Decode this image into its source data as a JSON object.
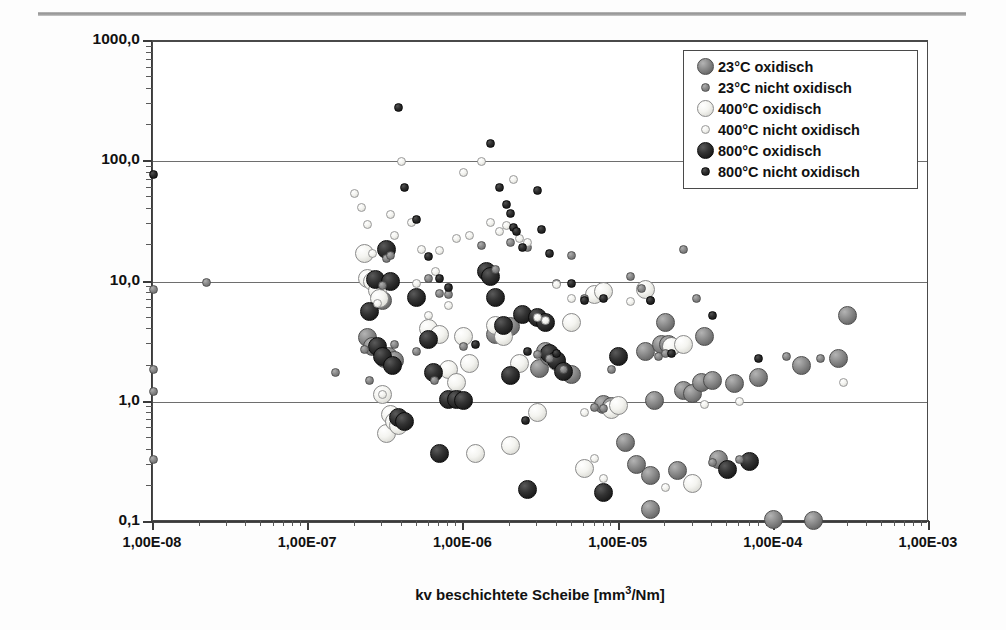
{
  "figure": {
    "background": "#ffffff",
    "frame_color": "#4a4a4a",
    "has_top_rule": true
  },
  "axes": {
    "x_title": "kv  beschichtete Scheibe [mm",
    "x_title_sup": "3",
    "x_title_tail": "/Nm]",
    "y_title": "P x V [MPa*ms",
    "y_title_sup": "-1",
    "y_title_tail": "]",
    "x_ticklabels": [
      "1,00E-08",
      "1,00E-07",
      "1,00E-06",
      "1,00E-05",
      "1,00E-04",
      "1,00E-03"
    ],
    "y_ticklabels": [
      "1000,0",
      "100,0",
      "10,0",
      "1,0",
      "0,1"
    ]
  },
  "legend": {
    "position": "top-right",
    "entries": [
      {
        "label": "23°C oxidisch",
        "series": 0,
        "size": "large",
        "color": "#8f8f8f"
      },
      {
        "label": "23°C nicht oxidisch",
        "series": 1,
        "size": "small",
        "color": "#898989"
      },
      {
        "label": "400°C oxidisch",
        "series": 2,
        "size": "large",
        "color": "#ffffff"
      },
      {
        "label": "400°C nicht oxidisch",
        "series": 3,
        "size": "small",
        "color": "#ffffff"
      },
      {
        "label": "800°C oxidisch",
        "series": 4,
        "size": "large",
        "color": "#1c1c1c"
      },
      {
        "label": "800°C nicht oxidisch",
        "series": 5,
        "size": "small",
        "color": "#141414"
      }
    ]
  },
  "chart_data": {
    "type": "scatter",
    "title": "",
    "xlabel": "kv  beschichtete Scheibe [mm³/Nm]",
    "ylabel": "P x V [MPa*ms⁻¹]",
    "xscale": "log",
    "yscale": "log",
    "xlim": [
      1e-08,
      0.001
    ],
    "ylim": [
      0.1,
      1000.0
    ],
    "grid": "horizontal-decades",
    "legend_position": "top-right",
    "series": [
      {
        "name": "23°C oxidisch",
        "marker": "sphere-large",
        "color": "#8f8f8f",
        "points": [
          [
            2.4e-07,
            3.4
          ],
          [
            2.6e-07,
            2.9
          ],
          [
            3e-07,
            7.0
          ],
          [
            3.1e-07,
            2.3
          ],
          [
            3.3e-07,
            2.4
          ],
          [
            3.6e-07,
            2.2
          ],
          [
            1.6e-06,
            3.6
          ],
          [
            2e-06,
            4.2
          ],
          [
            3.1e-06,
            1.9
          ],
          [
            3.4e-06,
            2.6
          ],
          [
            3.6e-06,
            2.4
          ],
          [
            5e-06,
            1.7
          ],
          [
            8e-06,
            0.95
          ],
          [
            9e-06,
            0.92
          ],
          [
            1.1e-05,
            0.46
          ],
          [
            1.3e-05,
            0.3
          ],
          [
            1.5e-05,
            2.6
          ],
          [
            1.6e-05,
            0.245
          ],
          [
            1.6e-05,
            0.126
          ],
          [
            1.7e-05,
            1.02
          ],
          [
            1.9e-05,
            3.0
          ],
          [
            2e-05,
            4.6
          ],
          [
            2.1e-05,
            3.0
          ],
          [
            2.2e-05,
            2.9
          ],
          [
            2.4e-05,
            0.27
          ],
          [
            2.6e-05,
            1.25
          ],
          [
            3e-05,
            1.17
          ],
          [
            3.4e-05,
            1.45
          ],
          [
            3.6e-05,
            3.5
          ],
          [
            4e-05,
            1.5
          ],
          [
            4.4e-05,
            0.33
          ],
          [
            5.6e-05,
            1.42
          ],
          [
            8e-05,
            1.6
          ],
          [
            0.0001,
            0.105
          ],
          [
            0.00015,
            2.0
          ],
          [
            0.00018,
            0.102
          ],
          [
            0.00026,
            2.3
          ],
          [
            0.0003,
            5.2
          ]
        ]
      },
      {
        "name": "23°C nicht oxidisch",
        "marker": "sphere-small",
        "color": "#898989",
        "points": [
          [
            1e-08,
            8.6
          ],
          [
            1e-08,
            1.85
          ],
          [
            1e-08,
            1.22
          ],
          [
            1e-08,
            0.33
          ],
          [
            2.2e-08,
            9.8
          ],
          [
            1.5e-07,
            1.75
          ],
          [
            2.3e-07,
            2.7
          ],
          [
            2.5e-07,
            1.5
          ],
          [
            3e-07,
            9.3
          ],
          [
            3.2e-07,
            15.5
          ],
          [
            3.4e-07,
            16.5
          ],
          [
            3.6e-07,
            3.0
          ],
          [
            5e-07,
            2.6
          ],
          [
            6e-07,
            10.5
          ],
          [
            6.5e-07,
            1.5
          ],
          [
            7e-07,
            8.0
          ],
          [
            8e-07,
            7.8
          ],
          [
            1e-06,
            2.9
          ],
          [
            1.3e-06,
            20.0
          ],
          [
            1.6e-06,
            12.5
          ],
          [
            2e-06,
            21.0
          ],
          [
            2.6e-06,
            19.0
          ],
          [
            3e-06,
            2.45
          ],
          [
            3.6e-06,
            2.3
          ],
          [
            4e-06,
            9.7
          ],
          [
            4.4e-06,
            1.85
          ],
          [
            5e-06,
            16.5
          ],
          [
            6e-06,
            7.2
          ],
          [
            7e-06,
            0.9
          ],
          [
            8e-06,
            0.88
          ],
          [
            9e-06,
            1.85
          ],
          [
            1.2e-05,
            11.0
          ],
          [
            1.4e-05,
            8.8
          ],
          [
            1.6e-05,
            7.0
          ],
          [
            1.8e-05,
            2.4
          ],
          [
            2e-05,
            2.5
          ],
          [
            2.6e-05,
            18.5
          ],
          [
            3.2e-05,
            7.2
          ],
          [
            4e-05,
            0.31
          ],
          [
            6e-05,
            0.33
          ],
          [
            0.00012,
            2.4
          ],
          [
            0.0002,
            2.3
          ]
        ]
      },
      {
        "name": "400°C oxidisch",
        "marker": "sphere-large",
        "color": "#ffffff",
        "points": [
          [
            2.3e-07,
            17.0
          ],
          [
            2.4e-07,
            10.6
          ],
          [
            2.6e-07,
            10.0
          ],
          [
            2.8e-07,
            8.4
          ],
          [
            2.9e-07,
            7.2
          ],
          [
            3e-07,
            1.15
          ],
          [
            3.2e-07,
            0.54
          ],
          [
            3.4e-07,
            0.78
          ],
          [
            3.6e-07,
            0.68
          ],
          [
            3.8e-07,
            0.64
          ],
          [
            6e-07,
            4.1
          ],
          [
            7e-07,
            3.6
          ],
          [
            8e-07,
            1.85
          ],
          [
            9e-07,
            1.45
          ],
          [
            1e-06,
            3.5
          ],
          [
            1.1e-06,
            2.1
          ],
          [
            1.2e-06,
            0.37
          ],
          [
            1.6e-06,
            4.3
          ],
          [
            1.8e-06,
            3.5
          ],
          [
            2e-06,
            0.43
          ],
          [
            2.3e-06,
            2.1
          ],
          [
            3e-06,
            0.82
          ],
          [
            4e-06,
            2.15
          ],
          [
            5e-06,
            4.6
          ],
          [
            6e-06,
            0.28
          ],
          [
            7e-06,
            7.8
          ],
          [
            8e-06,
            8.2
          ],
          [
            9e-06,
            0.86
          ],
          [
            1e-05,
            0.93
          ],
          [
            1.5e-05,
            8.5
          ],
          [
            2.2e-05,
            2.9
          ],
          [
            2.6e-05,
            3.0
          ],
          [
            3e-05,
            0.21
          ]
        ]
      },
      {
        "name": "400°C nicht oxidisch",
        "marker": "sphere-small",
        "color": "#ffffff",
        "points": [
          [
            2e-07,
            54.0
          ],
          [
            2.2e-07,
            41.0
          ],
          [
            2.4e-07,
            30.0
          ],
          [
            2.6e-07,
            17.0
          ],
          [
            2.8e-07,
            6.6
          ],
          [
            3e-07,
            1.15
          ],
          [
            3.4e-07,
            36.0
          ],
          [
            3.6e-07,
            24.0
          ],
          [
            4e-07,
            100.0
          ],
          [
            4.6e-07,
            31.0
          ],
          [
            5e-07,
            9.6
          ],
          [
            5.4e-07,
            18.5
          ],
          [
            6e-07,
            5.2
          ],
          [
            6.6e-07,
            12.0
          ],
          [
            7e-07,
            18.0
          ],
          [
            8e-07,
            6.3
          ],
          [
            9e-07,
            23.0
          ],
          [
            1e-06,
            80.0
          ],
          [
            1.1e-06,
            24.0
          ],
          [
            1.3e-06,
            100.0
          ],
          [
            1.5e-06,
            31.0
          ],
          [
            1.7e-06,
            26.0
          ],
          [
            1.9e-06,
            29.0
          ],
          [
            2.1e-06,
            70.0
          ],
          [
            2.3e-06,
            23.0
          ],
          [
            2.6e-06,
            21.0
          ],
          [
            3e-06,
            5.0
          ],
          [
            3.4e-06,
            4.7
          ],
          [
            4e-06,
            9.4
          ],
          [
            5e-06,
            7.2
          ],
          [
            6e-06,
            0.81
          ],
          [
            7e-06,
            0.34
          ],
          [
            8e-06,
            0.23
          ],
          [
            1.2e-05,
            6.8
          ],
          [
            2e-05,
            0.195
          ],
          [
            3.6e-05,
            0.95
          ],
          [
            6e-05,
            1.0
          ],
          [
            0.00028,
            1.45
          ]
        ]
      },
      {
        "name": "800°C oxidisch",
        "marker": "sphere-large",
        "color": "#1c1c1c",
        "points": [
          [
            2.5e-07,
            5.6
          ],
          [
            2.7e-07,
            10.3
          ],
          [
            2.8e-07,
            2.9
          ],
          [
            3e-07,
            2.4
          ],
          [
            3.2e-07,
            18.5
          ],
          [
            3.4e-07,
            10.0
          ],
          [
            3.5e-07,
            2.0
          ],
          [
            3.8e-07,
            0.74
          ],
          [
            4.2e-07,
            0.69
          ],
          [
            5e-07,
            7.4
          ],
          [
            6e-07,
            3.3
          ],
          [
            6.4e-07,
            1.75
          ],
          [
            7e-07,
            0.37
          ],
          [
            8e-07,
            1.05
          ],
          [
            9e-07,
            1.05
          ],
          [
            1e-06,
            1.02
          ],
          [
            1.4e-06,
            12.0
          ],
          [
            1.5e-06,
            11.0
          ],
          [
            1.6e-06,
            7.4
          ],
          [
            1.8e-06,
            4.3
          ],
          [
            2e-06,
            1.65
          ],
          [
            2.4e-06,
            5.3
          ],
          [
            2.6e-06,
            0.185
          ],
          [
            3e-06,
            5.0
          ],
          [
            3.4e-06,
            4.6
          ],
          [
            3.6e-06,
            2.5
          ],
          [
            4e-06,
            2.2
          ],
          [
            4.4e-06,
            1.8
          ],
          [
            8e-06,
            0.175
          ],
          [
            1e-05,
            2.4
          ],
          [
            5e-05,
            0.275
          ],
          [
            7e-05,
            0.32
          ]
        ]
      },
      {
        "name": "800°C nicht oxidisch",
        "marker": "sphere-small",
        "color": "#141414",
        "points": [
          [
            1e-08,
            78.0
          ],
          [
            3.8e-07,
            280.0
          ],
          [
            4.2e-07,
            60.0
          ],
          [
            5e-07,
            33.0
          ],
          [
            6e-07,
            16.0
          ],
          [
            7e-07,
            10.6
          ],
          [
            8e-07,
            9.0
          ],
          [
            1.2e-06,
            3.0
          ],
          [
            1.5e-06,
            140.0
          ],
          [
            1.7e-06,
            60.0
          ],
          [
            1.9e-06,
            44.0
          ],
          [
            2e-06,
            37.0
          ],
          [
            2.1e-06,
            28.0
          ],
          [
            2.2e-06,
            26.0
          ],
          [
            2.4e-06,
            19.0
          ],
          [
            2.5e-06,
            0.7
          ],
          [
            2.6e-06,
            2.6
          ],
          [
            3e-06,
            57.0
          ],
          [
            3.2e-06,
            27.0
          ],
          [
            3.6e-06,
            17.0
          ],
          [
            4e-06,
            2.5
          ],
          [
            5e-06,
            9.6
          ],
          [
            6e-06,
            7.0
          ],
          [
            8e-06,
            7.2
          ],
          [
            1.6e-05,
            6.9
          ],
          [
            2.2e-05,
            2.5
          ],
          [
            4e-05,
            5.2
          ],
          [
            8e-05,
            2.3
          ]
        ]
      }
    ]
  }
}
